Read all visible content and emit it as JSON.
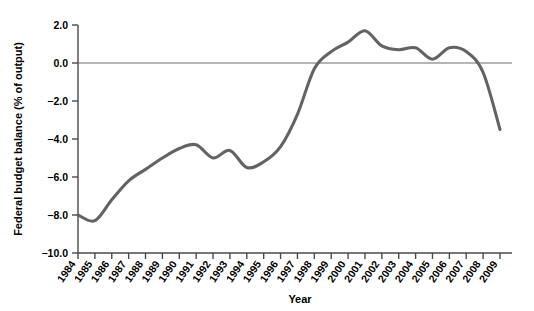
{
  "chart_data": {
    "type": "line",
    "title": "",
    "xlabel": "Year",
    "ylabel": "Federal budget balance (% of output)",
    "xlim": [
      1984,
      2009
    ],
    "ylim": [
      -10.0,
      2.0
    ],
    "ytick_labels": [
      "2.0",
      "0.0",
      "-2.0",
      "-4.0",
      "-6.0",
      "-8.0",
      "-10.0"
    ],
    "ytick_values": [
      2.0,
      0.0,
      -2.0,
      -4.0,
      -6.0,
      -8.0,
      -10.0
    ],
    "grid": false,
    "legend": "none",
    "zero_line": true,
    "series_color": "#636363",
    "categories": [
      "1984",
      "1985",
      "1986",
      "1987",
      "1988",
      "1989",
      "1990",
      "1991",
      "1992",
      "1993",
      "1994",
      "1995",
      "1996",
      "1997",
      "1998",
      "1999",
      "2000",
      "2001",
      "2002",
      "2003",
      "2004",
      "2005",
      "2006",
      "2007",
      "2008",
      "2009"
    ],
    "series": [
      {
        "name": "Federal budget balance",
        "values": [
          -8.0,
          -8.3,
          -7.2,
          -6.2,
          -5.6,
          -5.0,
          -4.5,
          -4.3,
          -5.0,
          -4.6,
          -5.5,
          -5.2,
          -4.4,
          -2.7,
          -0.3,
          0.6,
          1.1,
          1.7,
          0.9,
          0.7,
          0.8,
          0.2,
          0.8,
          0.6,
          -0.5,
          -3.5
        ]
      }
    ]
  }
}
